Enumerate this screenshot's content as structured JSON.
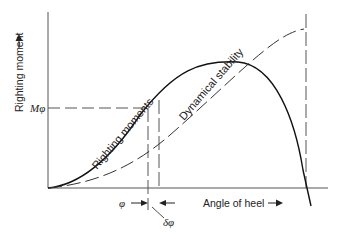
{
  "diagram": {
    "y_axis_label": "Righting moment",
    "x_axis_label": "Angle of heel",
    "moment_marker_label": "Mφ",
    "angle_label": "φ",
    "delta_angle_label": "δφ",
    "curves": [
      {
        "name": "Righting moments",
        "style": "solid"
      },
      {
        "name": "Dynamical stability",
        "style": "dashed"
      }
    ],
    "arrow_icon": "arrow-right"
  }
}
